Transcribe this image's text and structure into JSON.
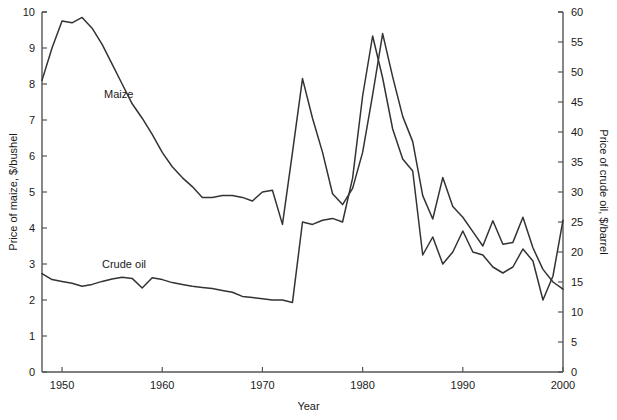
{
  "chart_data": {
    "type": "line",
    "title": "",
    "xlabel": "Year",
    "ylabel": "Price of maize, $/bushel",
    "ylabel_right": "Price of crude oil, $/barrel",
    "xlim": [
      1948,
      2000
    ],
    "ylim": [
      0,
      10
    ],
    "ylim_right": [
      0,
      60
    ],
    "grid": false,
    "legend": "inline-annotations",
    "xticks": [
      1950,
      1960,
      1970,
      1980,
      1990,
      2000
    ],
    "xtick_labels": [
      "1950",
      "1960",
      "1970",
      "1980",
      "1990",
      "2000"
    ],
    "yticks_left": [
      0,
      1,
      2,
      3,
      4,
      5,
      6,
      7,
      8,
      9,
      10
    ],
    "ytick_labels_left": [
      "0",
      "1",
      "2",
      "3",
      "4",
      "5",
      "6",
      "7",
      "8",
      "9",
      "10"
    ],
    "yticks_right": [
      0,
      5,
      10,
      15,
      20,
      25,
      30,
      35,
      40,
      45,
      50,
      55,
      60
    ],
    "ytick_labels_right": [
      "0",
      "5",
      "10",
      "15",
      "20",
      "25",
      "30",
      "35",
      "40",
      "45",
      "50",
      "55",
      "60"
    ],
    "annotations": [
      {
        "text": "Maize",
        "x": 1954.5,
        "y": 7.85
      },
      {
        "text": "Crude oil",
        "x": 1954.3,
        "y": 3.0
      }
    ],
    "line_color": "#333333",
    "x": [
      1948,
      1949,
      1950,
      1951,
      1952,
      1953,
      1954,
      1955,
      1956,
      1957,
      1958,
      1959,
      1960,
      1961,
      1962,
      1963,
      1964,
      1965,
      1966,
      1967,
      1968,
      1969,
      1970,
      1971,
      1972,
      1973,
      1974,
      1975,
      1976,
      1977,
      1978,
      1979,
      1980,
      1981,
      1982,
      1983,
      1984,
      1985,
      1986,
      1987,
      1988,
      1989,
      1990,
      1991,
      1992,
      1993,
      1994,
      1995,
      1996,
      1997,
      1998,
      1999,
      2000
    ],
    "series": [
      {
        "name": "Maize",
        "axis": "left",
        "unit": "$/bushel",
        "values": [
          8.1,
          9.0,
          9.75,
          9.7,
          9.85,
          9.55,
          9.1,
          8.55,
          8.0,
          7.45,
          7.05,
          6.6,
          6.1,
          5.7,
          5.4,
          5.15,
          4.85,
          4.85,
          4.9,
          4.9,
          4.85,
          4.75,
          5.0,
          5.05,
          4.1,
          6.1,
          8.15,
          7.05,
          6.1,
          4.95,
          4.65,
          5.1,
          6.1,
          7.7,
          9.4,
          8.2,
          7.1,
          6.4,
          4.9,
          4.25,
          5.4,
          4.6,
          4.3,
          3.9,
          3.5,
          4.2,
          3.55,
          3.6,
          4.3,
          3.45,
          2.85,
          2.5,
          2.3
        ],
        "approx_display_values_right_equivalent": null
      },
      {
        "name": "Crude oil",
        "axis": "right",
        "unit": "$/barrel",
        "values": [
          16.4,
          15.4,
          15.1,
          14.8,
          14.3,
          14.6,
          15.1,
          15.5,
          15.8,
          15.6,
          14.0,
          15.7,
          15.4,
          14.9,
          14.6,
          14.3,
          14.1,
          13.9,
          13.6,
          13.3,
          12.6,
          12.4,
          12.2,
          12.0,
          12.0,
          11.6,
          25.0,
          24.6,
          25.3,
          25.6,
          25.0,
          32.3,
          46.0,
          56.0,
          49.0,
          40.5,
          35.5,
          33.5,
          19.5,
          22.5,
          18.0,
          20.0,
          23.5,
          20.0,
          19.5,
          17.5,
          16.5,
          17.5,
          20.5,
          18.5,
          12.0,
          16.0,
          25.3
        ]
      }
    ]
  },
  "axes": {
    "left_title": "Price of maize, $/bushel",
    "right_title": "Price of crude oil, $/barrel",
    "bottom_title": "Year"
  },
  "labels": {
    "maize": "Maize",
    "crude_oil": "Crude oil"
  }
}
